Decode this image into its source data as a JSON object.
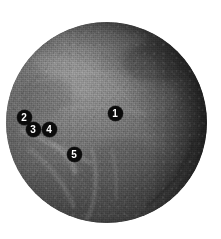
{
  "figure": {
    "background_color": "#ffffff",
    "specimen": {
      "shape": "sphere",
      "description": "Grainy grey-scale spherical specimen with mottled surface texture, lighter ridges toward lower-left and a dark limb band along the upper-right and lower-right edge",
      "center_x": 106,
      "center_y": 122,
      "diameter": 201,
      "base_color": "#6d6d6d",
      "highlight_color": "#8a8a8a",
      "shadow_color": "#3a3a3a",
      "rim_color": "#2e2e2e"
    },
    "markers": [
      {
        "id": "marker-1",
        "label": "1",
        "x": 115,
        "y": 113,
        "color": "#0b0b0b",
        "text_color": "#ffffff"
      },
      {
        "id": "marker-2",
        "label": "2",
        "x": 24,
        "y": 117,
        "color": "#0b0b0b",
        "text_color": "#ffffff"
      },
      {
        "id": "marker-3",
        "label": "3",
        "x": 33,
        "y": 129,
        "color": "#0b0b0b",
        "text_color": "#ffffff"
      },
      {
        "id": "marker-4",
        "label": "4",
        "x": 49,
        "y": 129,
        "color": "#0b0b0b",
        "text_color": "#ffffff"
      },
      {
        "id": "marker-5",
        "label": "5",
        "x": 74,
        "y": 154,
        "color": "#0b0b0b",
        "text_color": "#ffffff"
      }
    ]
  }
}
